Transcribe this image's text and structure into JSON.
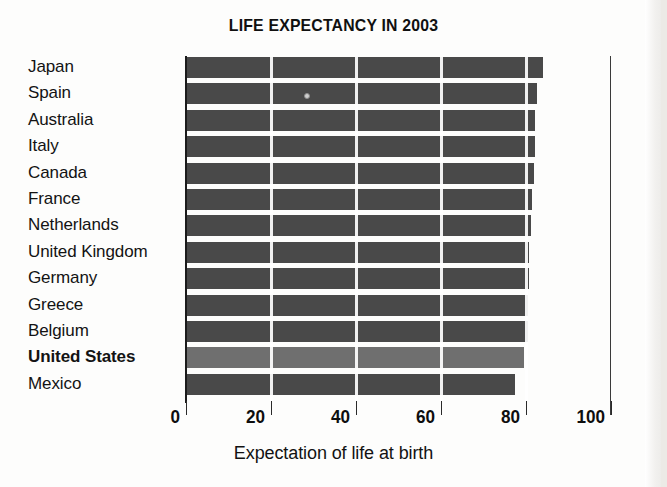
{
  "chart_data": {
    "type": "bar",
    "orientation": "horizontal",
    "title": "LIFE EXPECTANCY IN 2003",
    "xlabel": "Expectation of life at birth",
    "ylabel": "",
    "xlim": [
      0,
      100
    ],
    "xticks": [
      0,
      20,
      40,
      60,
      80,
      100
    ],
    "xtick_labels": [
      "0",
      "20",
      "40",
      "60",
      "80",
      "100"
    ],
    "grid": true,
    "legend": null,
    "categories": [
      "Japan",
      "Spain",
      "Australia",
      "Italy",
      "Canada",
      "France",
      "Netherlands",
      "United Kingdom",
      "Germany",
      "Greece",
      "Belgium",
      "United States",
      "Mexico"
    ],
    "values": [
      84.0,
      82.6,
      82.2,
      82.0,
      81.8,
      81.5,
      81.1,
      80.8,
      80.6,
      80.5,
      80.4,
      79.5,
      77.4
    ],
    "highlight_category": "United States",
    "colors": {
      "bar": "#494949",
      "bar_highlight": "#6f6f6f",
      "axis": "#1c1c1c",
      "text": "#121212",
      "background": "#fdfdfc"
    }
  },
  "axis": {
    "x_label": "Expectation of life at birth"
  },
  "title": {
    "text": "LIFE EXPECTANCY IN 2003"
  }
}
